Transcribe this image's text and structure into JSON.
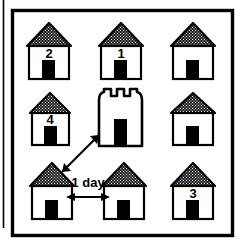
{
  "figure": {
    "type": "diagram",
    "background_color": "#ffffff",
    "ink_color": "#000000",
    "roof_fill_color": "#2b2b2b",
    "door_fill_color": "#000000",
    "wall_fill_color": "#ffffff"
  },
  "frame": {
    "border_label": "outer-frame",
    "margin_rule_label": "left-margin-rule"
  },
  "houses": [
    {
      "id": "house-top-left",
      "label": "2",
      "row": 1,
      "col": 1,
      "x": 27,
      "y": 22,
      "width": 44,
      "height": 56
    },
    {
      "id": "house-top-center",
      "label": "1",
      "row": 1,
      "col": 2,
      "x": 99,
      "y": 22,
      "width": 44,
      "height": 56
    },
    {
      "id": "house-top-right",
      "label": "",
      "row": 1,
      "col": 3,
      "x": 171,
      "y": 22,
      "width": 44,
      "height": 56
    },
    {
      "id": "house-middle-left",
      "label": "4",
      "row": 2,
      "col": 1,
      "x": 30,
      "y": 92,
      "width": 41,
      "height": 52
    },
    {
      "id": "house-middle-right",
      "label": "",
      "row": 2,
      "col": 3,
      "x": 171,
      "y": 92,
      "width": 44,
      "height": 52
    },
    {
      "id": "house-bottom-left",
      "label": "",
      "row": 3,
      "col": 1,
      "x": 30,
      "y": 162,
      "width": 44,
      "height": 56
    },
    {
      "id": "house-bottom-center",
      "label": "",
      "row": 3,
      "col": 2,
      "x": 102,
      "y": 162,
      "width": 44,
      "height": 56
    },
    {
      "id": "house-bottom-right",
      "label": "3",
      "row": 3,
      "col": 3,
      "x": 171,
      "y": 162,
      "width": 44,
      "height": 56
    }
  ],
  "tower": {
    "id": "central-tower",
    "label": "",
    "merlon_count": 3,
    "x": 97,
    "y": 88,
    "width": 46,
    "height": 58
  },
  "annotations": {
    "distance_label": "1 day",
    "horizontal_arrow": {
      "name": "one-day-distance-arrow",
      "double_headed": true,
      "from": "house-bottom-left",
      "to": "house-bottom-center"
    },
    "diagonal_arrow": {
      "name": "house-to-tower-arrow",
      "double_headed": true,
      "from": "house-bottom-left",
      "to": "central-tower"
    }
  }
}
